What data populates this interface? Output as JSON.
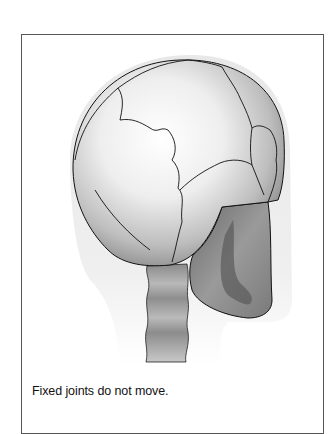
{
  "figure": {
    "caption": "Fixed joints do not move."
  }
}
